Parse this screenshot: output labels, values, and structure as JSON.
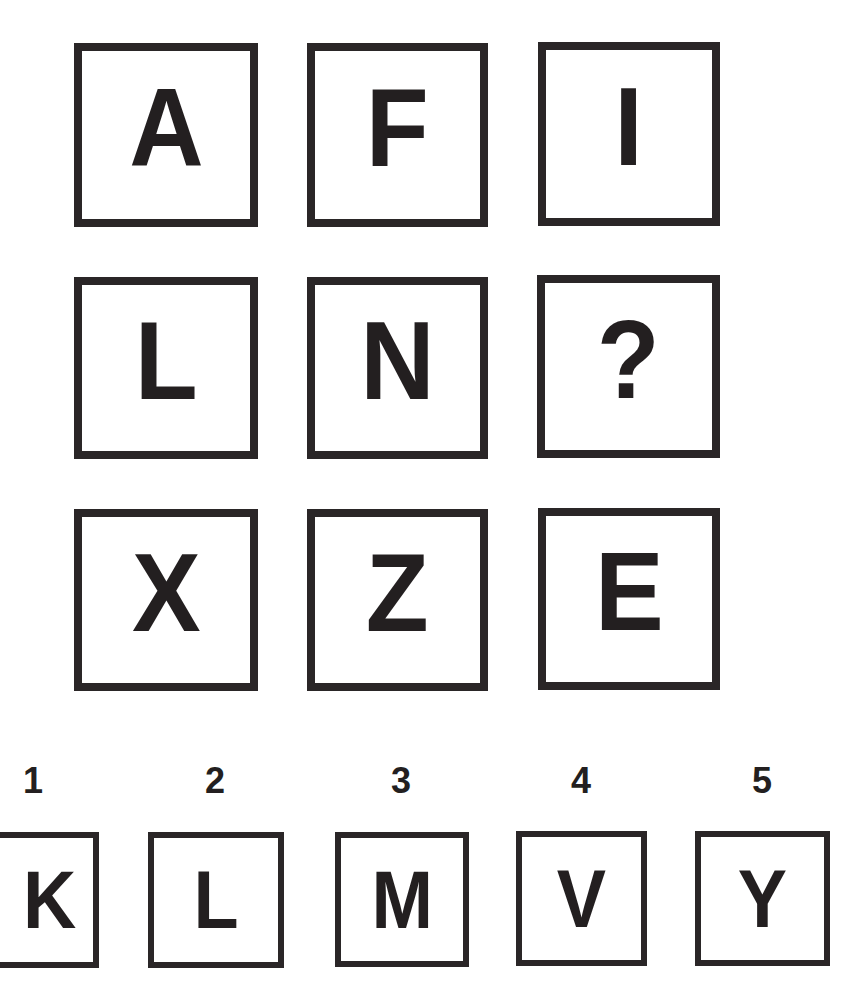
{
  "puzzle": {
    "grid": [
      [
        "A",
        "F",
        "I"
      ],
      [
        "L",
        "N",
        "?"
      ],
      [
        "X",
        "Z",
        "E"
      ]
    ],
    "options": [
      {
        "number": "1",
        "letter": "K"
      },
      {
        "number": "2",
        "letter": "L"
      },
      {
        "number": "3",
        "letter": "M"
      },
      {
        "number": "4",
        "letter": "V"
      },
      {
        "number": "5",
        "letter": "Y"
      }
    ]
  }
}
